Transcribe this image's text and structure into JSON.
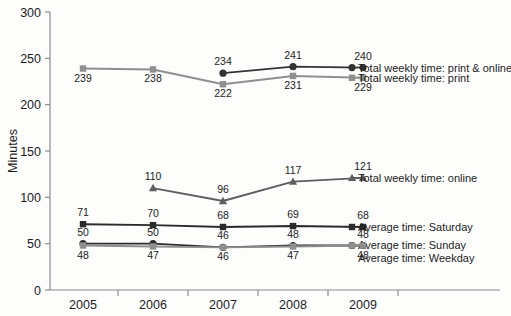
{
  "chart_data": {
    "type": "line",
    "title": "",
    "xlabel": "",
    "ylabel": "Minutes",
    "categories": [
      "2005",
      "2006",
      "2007",
      "2008",
      "2009"
    ],
    "ylim": [
      0,
      300
    ],
    "yticks": [
      0,
      50,
      100,
      150,
      200,
      250,
      300
    ],
    "grid": false,
    "legend_position": "right-inline",
    "series": [
      {
        "name": "Total weekly time: print & online",
        "color": "#333333",
        "marker": "circle",
        "x": [
          "2007",
          "2008",
          "2009"
        ],
        "values": [
          234,
          241,
          240
        ],
        "labels": [
          "234",
          "241",
          "240"
        ]
      },
      {
        "name": "Total weekly time: print",
        "color": "#8f8f8f",
        "marker": "square",
        "x": [
          "2005",
          "2006",
          "2007",
          "2008",
          "2009"
        ],
        "values": [
          239,
          238,
          222,
          231,
          229
        ],
        "labels": [
          "239",
          "238",
          "222",
          "231",
          "229"
        ]
      },
      {
        "name": "Total weekly time: online",
        "color": "#5e5e5e",
        "marker": "triangle",
        "x": [
          "2006",
          "2007",
          "2008",
          "2009"
        ],
        "values": [
          110,
          96,
          117,
          121
        ],
        "labels": [
          "110",
          "96",
          "117",
          "121"
        ]
      },
      {
        "name": "Average time: Saturday",
        "color": "#2b2b2b",
        "marker": "square",
        "x": [
          "2005",
          "2006",
          "2007",
          "2008",
          "2009"
        ],
        "values": [
          71,
          70,
          68,
          69,
          68
        ],
        "labels": [
          "71",
          "70",
          "68",
          "69",
          "68"
        ]
      },
      {
        "name": "Average time: Sunday",
        "color": "#2b2b2b",
        "marker": "circle",
        "x": [
          "2005",
          "2006",
          "2007",
          "2008",
          "2009"
        ],
        "values": [
          50,
          50,
          46,
          48,
          48
        ],
        "labels": [
          "50",
          "50",
          "46",
          "48",
          "48"
        ]
      },
      {
        "name": "Average time: Weekday",
        "color": "#8f8f8f",
        "marker": "square",
        "x": [
          "2005",
          "2006",
          "2007",
          "2008",
          "2009"
        ],
        "values": [
          48,
          47,
          46,
          47,
          48
        ],
        "labels": [
          "48",
          "47",
          "46",
          "47",
          "48"
        ]
      }
    ]
  },
  "axis": {
    "y_title": "Minutes",
    "y_ticks": [
      "300",
      "250",
      "200",
      "150",
      "100",
      "50",
      "0"
    ],
    "x_ticks": [
      "2005",
      "2006",
      "2007",
      "2008",
      "2009"
    ]
  },
  "legend": {
    "items": [
      "Total weekly time: print & online",
      "Total weekly time: print",
      "Total weekly time: online",
      "Average time: Saturday",
      "Average time: Sunday",
      "Average time: Weekday"
    ]
  },
  "labels": {
    "print_online": [
      "234",
      "241",
      "240"
    ],
    "print": [
      "239",
      "238",
      "222",
      "231",
      "229"
    ],
    "online": [
      "110",
      "96",
      "117",
      "121"
    ],
    "saturday": [
      "71",
      "70",
      "68",
      "69",
      "68"
    ],
    "sunday": [
      "50",
      "50",
      "46",
      "48",
      "48"
    ],
    "weekday": [
      "48",
      "47",
      "46",
      "47",
      "48"
    ]
  },
  "colors": {
    "dark": "#333333",
    "mid": "#5e5e5e",
    "light": "#8f8f8f",
    "axis": "#8c8c8c",
    "text": "#1c1c1c",
    "background": "#fdfdfc"
  }
}
